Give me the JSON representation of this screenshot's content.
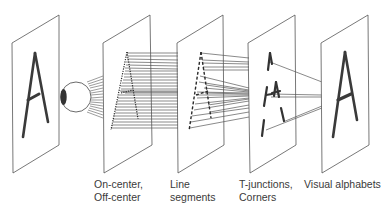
{
  "diagram": {
    "input_letter": "A",
    "stages": [
      {
        "id": "input-image",
        "label_lines": []
      },
      {
        "id": "on-off-center",
        "label_lines": [
          "On-center,",
          "Off-center"
        ]
      },
      {
        "id": "line-segments",
        "label_lines": [
          "Line",
          "segments"
        ]
      },
      {
        "id": "t-junctions-corners",
        "label_lines": [
          "T-junctions,",
          "Corners"
        ]
      },
      {
        "id": "visual-alphabets",
        "label_lines": [
          "Visual alphabets"
        ]
      }
    ],
    "icons": {
      "eye": "eye-icon"
    },
    "colors": {
      "outline": "#555555",
      "stroke": "#333333",
      "label": "#3a3a3a",
      "background": "#ffffff"
    }
  }
}
